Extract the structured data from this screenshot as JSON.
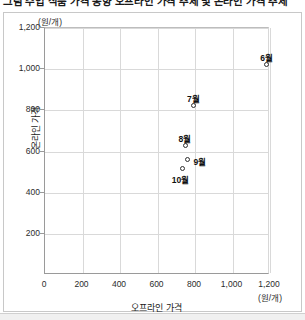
{
  "figure": {
    "title": "그림 수입 식품 가격 동향  오프라인 가격 추세 및 온라인 가격 추세",
    "y_unit": "(원/개)",
    "x_unit": "(원/개)"
  },
  "chart_data": {
    "type": "scatter",
    "title": "",
    "xlabel": "오프라인 가격",
    "ylabel": "온라인 가격",
    "xlim": [
      0,
      1200
    ],
    "ylim": [
      0,
      1200
    ],
    "x_unit": "(원/개)",
    "y_unit": "(원/개)",
    "grid": true,
    "legend": "none",
    "xticks": [
      "0",
      "200",
      "400",
      "600",
      "800",
      "1,000",
      "1,200"
    ],
    "xtick_values": [
      0,
      200,
      400,
      600,
      800,
      1000,
      1200
    ],
    "yticks": [
      "200",
      "400",
      "600",
      "800",
      "1,000",
      "1,200"
    ],
    "ytick_values": [
      200,
      400,
      600,
      800,
      1000,
      1200
    ],
    "points": [
      {
        "label": "6월",
        "x": 1190,
        "y": 1015,
        "label_pos": "above"
      },
      {
        "label": "7월",
        "x": 800,
        "y": 815,
        "label_pos": "above"
      },
      {
        "label": "8월",
        "x": 755,
        "y": 620,
        "label_pos": "above"
      },
      {
        "label": "9월",
        "x": 770,
        "y": 555,
        "label_pos": "right"
      },
      {
        "label": "10월",
        "x": 740,
        "y": 510,
        "label_pos": "below"
      }
    ]
  }
}
